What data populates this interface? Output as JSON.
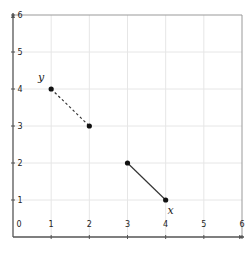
{
  "chart_data": {
    "type": "line",
    "title": "",
    "xlabel": "",
    "ylabel": "",
    "xlim": [
      0,
      6
    ],
    "ylim": [
      0,
      6
    ],
    "grid": true,
    "x_ticks": [
      "0",
      "1",
      "2",
      "3",
      "4",
      "5",
      "6"
    ],
    "y_ticks": [
      "1",
      "2",
      "3",
      "4",
      "5",
      "6"
    ],
    "series": [
      {
        "name": "y",
        "style": "dashed",
        "color": "#333333",
        "points": [
          {
            "x": 1,
            "y": 4
          },
          {
            "x": 2,
            "y": 3
          }
        ],
        "label": "y",
        "label_at": {
          "x": 1,
          "y": 4
        }
      },
      {
        "name": "x",
        "style": "solid",
        "color": "#333333",
        "points": [
          {
            "x": 3,
            "y": 2
          },
          {
            "x": 4,
            "y": 1
          }
        ],
        "label": "x",
        "label_at": {
          "x": 4,
          "y": 1
        }
      }
    ],
    "legend": "none"
  },
  "colors": {
    "axis": "#555555",
    "grid": "#e6e6e6",
    "line": "#333333",
    "point": "#111111"
  }
}
